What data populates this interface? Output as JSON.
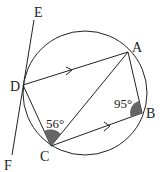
{
  "diagram": {
    "type": "circle-geometry",
    "points": {
      "A": {
        "label": "A",
        "x": 128,
        "y": 52
      },
      "B": {
        "label": "B",
        "x": 142,
        "y": 113
      },
      "C": {
        "label": "C",
        "x": 51,
        "y": 146
      },
      "D": {
        "label": "D",
        "x": 23,
        "y": 85
      },
      "E": {
        "label": "E"
      },
      "F": {
        "label": "F"
      }
    },
    "angles": {
      "angle_C": "56°",
      "angle_B": "95°"
    },
    "colors": {
      "stroke": "#222222",
      "angle_fill": "#666666"
    }
  }
}
